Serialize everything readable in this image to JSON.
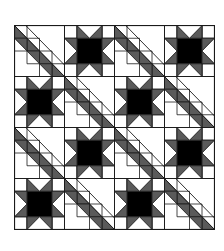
{
  "quilt": {
    "rows": 4,
    "cols": 4,
    "block_size": 50,
    "colors": {
      "background": "#ffffff",
      "gray": "#5a5a5a",
      "black": "#000000",
      "line": "#1a1a1a"
    },
    "layout": [
      [
        "diagonal",
        "star",
        "diagonal",
        "star"
      ],
      [
        "star",
        "diagonal",
        "star",
        "diagonal"
      ],
      [
        "diagonal",
        "star",
        "diagonal",
        "star"
      ],
      [
        "star",
        "diagonal",
        "star",
        "diagonal"
      ]
    ]
  }
}
